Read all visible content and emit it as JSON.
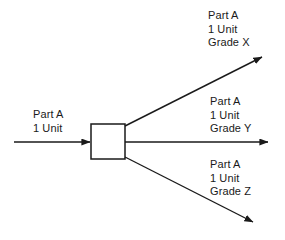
{
  "diagram": {
    "type": "process-flow",
    "background_color": "#ffffff",
    "line_color": "#1a1a1a",
    "text_color": "#1a1a1a",
    "process_box": {
      "label": "",
      "fill": "#ffffff",
      "stroke": "#1a1a1a"
    },
    "input": {
      "name": "input-flow",
      "line1": "Part A",
      "line2": "1 Unit"
    },
    "outputs": [
      {
        "name": "output-grade-x",
        "direction": "up",
        "line1": "Part A",
        "line2": "1 Unit",
        "line3": "Grade X"
      },
      {
        "name": "output-grade-y",
        "direction": "straight",
        "line1": "Part A",
        "line2": "1 Unit",
        "line3": "Grade Y"
      },
      {
        "name": "output-grade-z",
        "direction": "down",
        "line1": "Part A",
        "line2": "1 Unit",
        "line3": "Grade Z"
      }
    ]
  }
}
